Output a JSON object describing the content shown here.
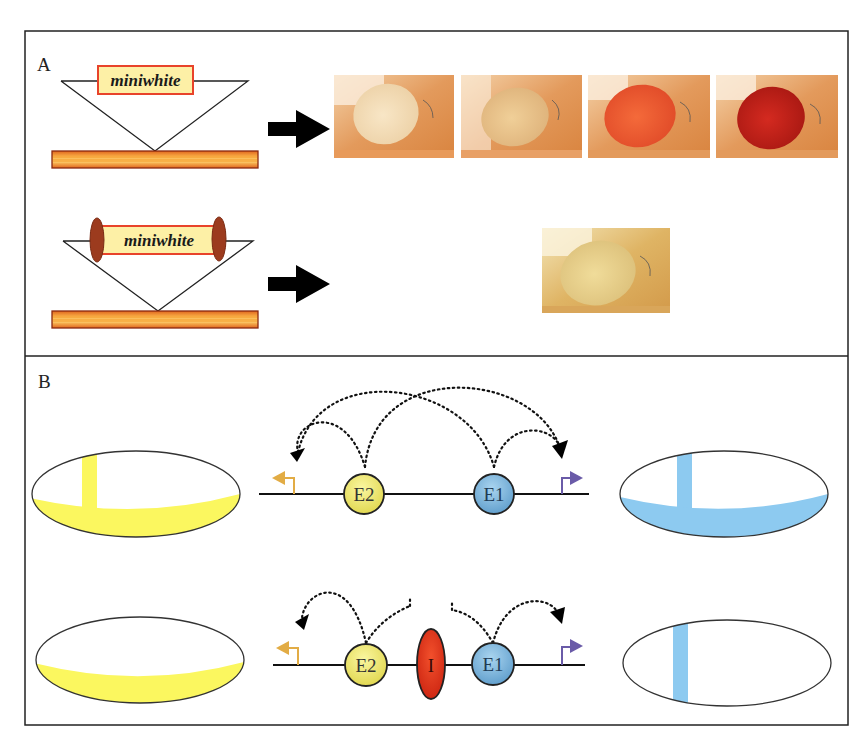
{
  "figure": {
    "frame": {
      "left": 25,
      "top": 31,
      "right": 848,
      "bottom": 725,
      "divider_y": 356,
      "stroke": "#222222"
    },
    "panel_a": {
      "label": "A",
      "constructs": [
        {
          "id": "unflanked",
          "transgene_label": "miniwhite",
          "insulators": false,
          "result_caption": "variable eye color (position effect)",
          "eye_photos": [
            {
              "pigment": "white",
              "color": "#f2dcb8"
            },
            {
              "pigment": "pale yellow",
              "color": "#e9c58e"
            },
            {
              "pigment": "orange-red",
              "color": "#e8552a"
            },
            {
              "pigment": "dark red",
              "color": "#c2231c"
            }
          ]
        },
        {
          "id": "insulator-flanked",
          "transgene_label": "miniwhite",
          "insulators": true,
          "result_caption": "uniform eye color",
          "eye_photos": [
            {
              "pigment": "pale yellow",
              "color": "#e8cf8a"
            }
          ]
        }
      ],
      "colors": {
        "transgene_fill": "#fdf0a6",
        "transgene_border": "#e8432a",
        "chromosome_fill": "#f6a43a",
        "chromosome_border": "#8a2a10",
        "insulator_fill": "#9c3b1e",
        "arrow": "#000000"
      }
    },
    "panel_b": {
      "label": "B",
      "rows": [
        {
          "id": "no-insulator",
          "left_embryo": {
            "pattern": "stripe + ventral band",
            "color": "#fbf75f"
          },
          "right_embryo": {
            "pattern": "stripe + ventral band",
            "color": "#8dcaf0"
          },
          "elements": [
            {
              "type": "promoter",
              "direction": "left",
              "color": "#e2ac45"
            },
            {
              "type": "enhancer",
              "label": "E2",
              "color": "#f3ec7a"
            },
            {
              "type": "enhancer",
              "label": "E1",
              "color": "#7fb7dc"
            },
            {
              "type": "promoter",
              "direction": "right",
              "color": "#6a5ba8"
            }
          ],
          "interactions": [
            "E2→left promoter",
            "E2→right promoter",
            "E1→left promoter",
            "E1→right promoter"
          ]
        },
        {
          "id": "with-insulator",
          "left_embryo": {
            "pattern": "ventral band only",
            "color": "#fbf75f"
          },
          "right_embryo": {
            "pattern": "stripe only",
            "color": "#8dcaf0"
          },
          "elements": [
            {
              "type": "promoter",
              "direction": "left",
              "color": "#e2ac45"
            },
            {
              "type": "enhancer",
              "label": "E2",
              "color": "#f3ec7a"
            },
            {
              "type": "insulator",
              "label": "I",
              "color": "#e8301c"
            },
            {
              "type": "enhancer",
              "label": "E1",
              "color": "#7fb7dc"
            },
            {
              "type": "promoter",
              "direction": "right",
              "color": "#6a5ba8"
            }
          ],
          "interactions": [
            "E2→left promoter",
            "E2 blocked by I",
            "E1 blocked by I",
            "E1→right promoter"
          ]
        }
      ]
    }
  }
}
